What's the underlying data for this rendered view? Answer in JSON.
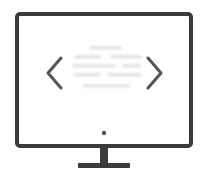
{
  "illustration": {
    "title": "Monitor slideshow",
    "subject": "desktop-monitor",
    "background_color": "#ffffff",
    "bezel_color": "#3b3b3b",
    "screen_color": "#ffffff",
    "inner_border_color": "#3b3b3b",
    "arrow_color": "#555555",
    "stand_color": "#3b3b3b",
    "power_dot_color": "#555555",
    "text_line_color": "#e4e4e4"
  },
  "monitor": {
    "outer_frame": {
      "x": 15,
      "y": 12,
      "width": 178,
      "height": 136,
      "stroke": 4,
      "radius": 3
    },
    "inner_screen": {
      "x": 26,
      "y": 25,
      "width": 156,
      "height": 96,
      "stroke": 3
    },
    "power_indicator": {
      "cx": 104,
      "cy": 133,
      "r": 2.2
    },
    "stand_neck": {
      "x": 100,
      "y": 148,
      "width": 8,
      "height": 16
    },
    "stand_base": {
      "x": 78,
      "y": 163,
      "width": 52,
      "height": 5,
      "radius": 1
    }
  },
  "nav": {
    "prev_label": "Previous",
    "prev_icon": "chevron-left-icon",
    "next_label": "Next",
    "next_icon": "chevron-right-icon",
    "prev_arrow": {
      "points": "61,58 48,73 61,88",
      "stroke": 3
    },
    "next_arrow": {
      "points": "148,58 161,73 148,88",
      "stroke": 3
    }
  },
  "content": {
    "description": "Blurred placeholder text lines on screen",
    "line_height": 3.4,
    "rows": [
      {
        "segments": [
          {
            "x": 90,
            "w": 32
          }
        ],
        "y": 46
      },
      {
        "segments": [
          {
            "x": 74,
            "w": 27
          },
          {
            "x": 110,
            "w": 32
          }
        ],
        "y": 55
      },
      {
        "segments": [
          {
            "x": 73,
            "w": 42
          },
          {
            "x": 122,
            "w": 19
          }
        ],
        "y": 64
      },
      {
        "segments": [
          {
            "x": 74,
            "w": 26
          },
          {
            "x": 108,
            "w": 33
          }
        ],
        "y": 73
      },
      {
        "segments": [
          {
            "x": 83,
            "w": 47
          }
        ],
        "y": 84
      }
    ]
  }
}
